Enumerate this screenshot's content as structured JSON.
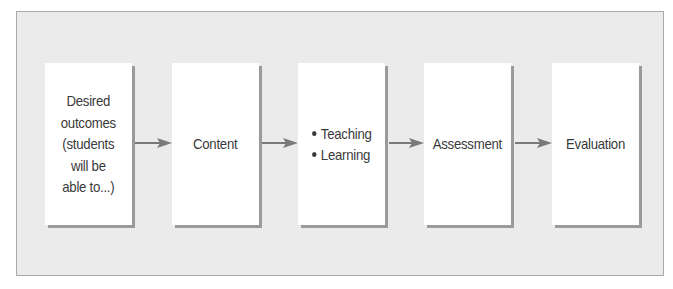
{
  "diagram": {
    "type": "flowchart",
    "direction": "left-to-right",
    "colors": {
      "frame_background": "#ebebeb",
      "frame_border": "#a9a9a9",
      "box_background": "#ffffff",
      "box_shadow": "#9a9a9a",
      "arrow": "#7a7a7a",
      "text": "#3a3a3a"
    },
    "steps": [
      {
        "label": "Desired\noutcomes\n(students\nwill be\nable to...)"
      },
      {
        "label": "Content"
      },
      {
        "items": [
          "Teaching",
          "Learning"
        ]
      },
      {
        "label": "Assessment"
      },
      {
        "label": "Evaluation"
      }
    ],
    "connections": [
      {
        "from": "Desired outcomes",
        "to": "Content"
      },
      {
        "from": "Content",
        "to": "Teaching / Learning"
      },
      {
        "from": "Teaching / Learning",
        "to": "Assessment"
      },
      {
        "from": "Assessment",
        "to": "Evaluation"
      }
    ]
  }
}
